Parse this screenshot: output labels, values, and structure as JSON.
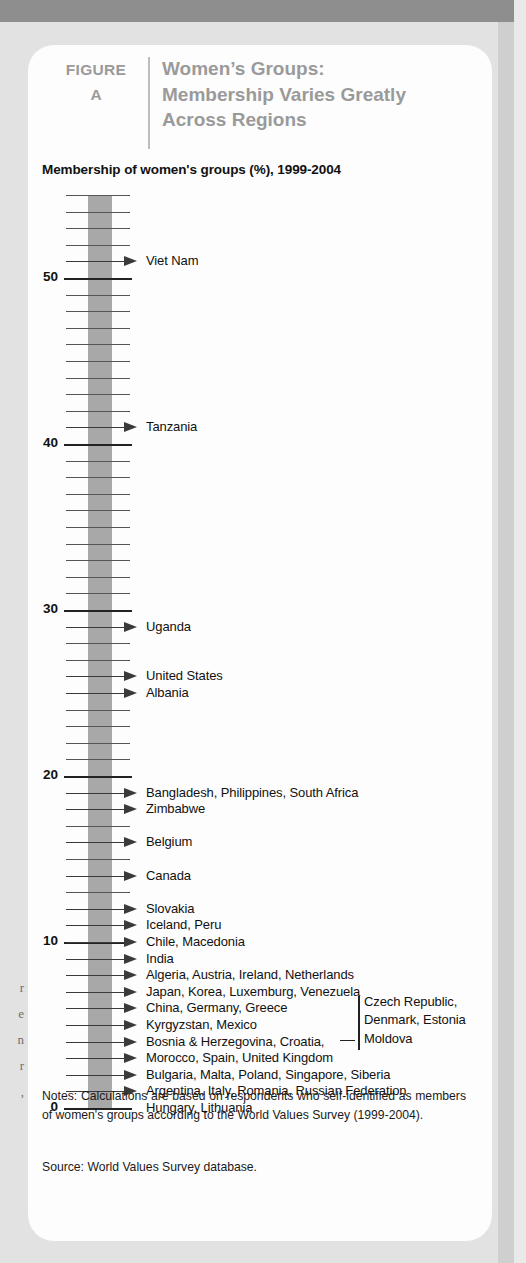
{
  "figure": {
    "label": "FIGURE",
    "letter": "A",
    "title_lines": [
      "Women’s Groups:",
      "Membership Varies Greatly",
      "Across Regions"
    ],
    "subtitle": "Membership of women's groups (%), 1999-2004"
  },
  "notes": {
    "text": "Notes: Calculations are based on respondents who self-identified as members of women's groups according to the World Values Survey (1999-2004).",
    "source": "Source: World Values Survey database."
  },
  "bleed_text": [
    "r",
    "e",
    "n",
    "r",
    ","
  ],
  "colors": {
    "top_bar": "#8e8e8e",
    "page_bg": "#e2e2e2",
    "card_bg": "#fdfdfd",
    "header_gray": "#9a9a9a",
    "band_gray": "#a8a8a8",
    "tick": "#3a3a3a",
    "text": "#111111"
  },
  "chart_data": {
    "type": "bar",
    "title": "Women’s Groups: Membership Varies Greatly Across Regions",
    "subtitle": "Membership of women's groups (%), 1999-2004",
    "xlabel": "",
    "ylabel": "Membership of women's groups (%)",
    "ylim": [
      0,
      55
    ],
    "grid": false,
    "legend": "none",
    "axis_ticks_major": [
      "0",
      "10",
      "20",
      "30",
      "40",
      "50"
    ],
    "axis_tick_values": [
      0,
      10,
      20,
      30,
      40,
      50
    ],
    "tick_interval": 1,
    "categories": [
      "Viet Nam",
      "Tanzania",
      "Uganda",
      "United States",
      "Albania",
      "Bangladesh, Philippines, South Africa",
      "Zimbabwe",
      "Belgium",
      "Canada",
      "Slovakia",
      "Iceland, Peru",
      "Chile, Macedonia",
      "India",
      "Algeria, Austria, Ireland, Netherlands",
      "Japan, Korea, Luxemburg, Venezuela",
      "China, Germany, Greece",
      "Kyrgyzstan, Mexico",
      "Bosnia & Herzegovina, Croatia,",
      "Morocco, Spain, United Kingdom",
      "Bulgaria, Malta, Poland, Singapore, Siberia",
      "Argentina, Italy, Romania, Russian Federation",
      "Hungary, Lithuania"
    ],
    "values": [
      51,
      41,
      29,
      26,
      25,
      19,
      18,
      16,
      14,
      12,
      11,
      10,
      9,
      8,
      7,
      6,
      5,
      4,
      3,
      2,
      1,
      0
    ],
    "side_note": {
      "connected_to": "Bosnia & Herzegovina, Croatia,",
      "lines": [
        "Czech Republic,",
        "Denmark, Estonia",
        "Moldova"
      ]
    }
  }
}
